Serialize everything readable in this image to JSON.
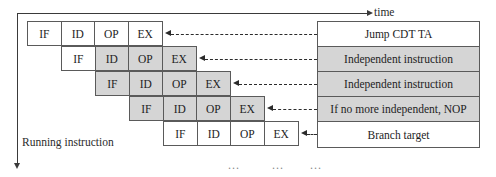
{
  "diagram": {
    "title_axes": {
      "time_label": "time",
      "running_label": "Running instruction"
    },
    "stage_names": [
      "IF",
      "ID",
      "OP",
      "EX"
    ],
    "pipeline_rows": [
      {
        "index": 1,
        "left": 27,
        "top": 21,
        "shaded": [
          false,
          false,
          false,
          false
        ]
      },
      {
        "index": 2,
        "left": 61,
        "top": 46,
        "shaded": [
          false,
          true,
          true,
          true
        ]
      },
      {
        "index": 3,
        "left": 95,
        "top": 71,
        "shaded": [
          true,
          true,
          true,
          true
        ]
      },
      {
        "index": 4,
        "left": 129,
        "top": 96,
        "shaded": [
          true,
          true,
          true,
          true
        ]
      },
      {
        "index": 5,
        "left": 163,
        "top": 121,
        "shaded": [
          false,
          false,
          false,
          false
        ]
      }
    ],
    "instructions": [
      {
        "label": "Jump CDT TA",
        "shaded": false
      },
      {
        "label": "Independent instruction",
        "shaded": true
      },
      {
        "label": "Independent instruction",
        "shaded": true
      },
      {
        "label": "If no more independent, NOP",
        "shaded": true
      },
      {
        "label": "Branch target",
        "shaded": false
      }
    ],
    "ellipses": [
      "...",
      "...",
      "..."
    ],
    "colors": {
      "shade": "#d5d5d5",
      "border": "#5a5a5a",
      "text": "#1d1d1d",
      "axis": "#3a3a3a"
    }
  }
}
